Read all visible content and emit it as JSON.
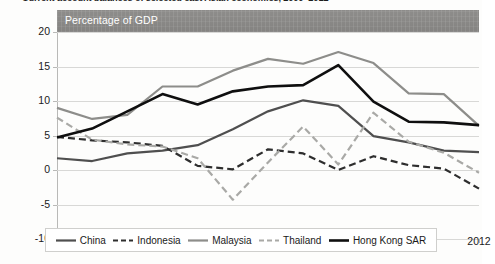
{
  "figure": {
    "title": "Current account balances of selected east Asian economies, 2000–2012",
    "unit_label": "Percentage of GDP"
  },
  "legend": {
    "items": [
      {
        "label": "China",
        "style": "solid",
        "color": "#4f4f4f",
        "width": 2.2,
        "icon": "line-solid-icon"
      },
      {
        "label": "Indonesia",
        "style": "dashed",
        "color": "#2e2e2e",
        "width": 2.2,
        "icon": "line-dashed-icon"
      },
      {
        "label": "Malaysia",
        "style": "solid",
        "color": "#8d8d8a",
        "width": 2.2,
        "icon": "line-solid-icon"
      },
      {
        "label": "Thailand",
        "style": "dashed",
        "color": "#a9a9a6",
        "width": 2.2,
        "icon": "line-dashed-icon"
      },
      {
        "label": "Hong Kong SAR",
        "style": "solid",
        "color": "#0f0f0f",
        "width": 2.6,
        "icon": "line-solid-icon"
      }
    ]
  },
  "chart_data": {
    "type": "line",
    "title": "Current account balances of selected east Asian economies, 2000–2012",
    "xlabel": "",
    "ylabel": "Percentage of GDP",
    "x": [
      2000,
      2001,
      2002,
      2003,
      2004,
      2005,
      2006,
      2007,
      2008,
      2009,
      2010,
      2011,
      2012
    ],
    "tick_labels_x": [
      "2000",
      "2002",
      "2004",
      "2006",
      "2008",
      "2010",
      "2012"
    ],
    "tick_values_x": [
      2000,
      2002,
      2004,
      2006,
      2008,
      2010,
      2012
    ],
    "ylim": [
      -10,
      20
    ],
    "tick_values_y": [
      -10,
      -5,
      0,
      5,
      10,
      15,
      20
    ],
    "tick_labels_y": [
      "-10",
      "-5",
      "0",
      "5",
      "10",
      "15",
      "20"
    ],
    "grid": true,
    "legend_position": "bottom",
    "series": [
      {
        "name": "China",
        "style": "solid",
        "color": "#4f4f4f",
        "values": [
          1.7,
          1.3,
          2.4,
          2.8,
          3.6,
          5.9,
          8.5,
          10.1,
          9.3,
          4.9,
          4.0,
          2.8,
          2.6
        ]
      },
      {
        "name": "Indonesia",
        "style": "dashed",
        "color": "#2e2e2e",
        "values": [
          4.8,
          4.3,
          4.0,
          3.5,
          0.6,
          0.1,
          3.0,
          2.4,
          0.0,
          2.0,
          0.7,
          0.2,
          -2.7
        ]
      },
      {
        "name": "Malaysia",
        "style": "solid",
        "color": "#8d8d8a",
        "values": [
          9.0,
          7.4,
          8.0,
          12.1,
          12.1,
          14.4,
          16.1,
          15.4,
          17.1,
          15.5,
          11.1,
          11.0,
          6.4
        ]
      },
      {
        "name": "Thailand",
        "style": "dashed",
        "color": "#a9a9a6",
        "values": [
          7.6,
          4.4,
          3.7,
          3.4,
          1.7,
          -4.3,
          1.1,
          6.3,
          0.8,
          8.3,
          4.1,
          2.5,
          -0.4
        ]
      },
      {
        "name": "Hong Kong SAR",
        "style": "solid",
        "color": "#0f0f0f",
        "values": [
          4.7,
          6.0,
          8.5,
          11.0,
          9.5,
          11.4,
          12.1,
          12.3,
          15.2,
          9.9,
          7.0,
          6.9,
          6.5
        ]
      }
    ]
  }
}
